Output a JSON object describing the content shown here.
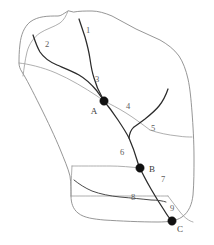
{
  "diagram": {
    "type": "watershed-stream-network",
    "title": "",
    "canvas": {
      "width": 214,
      "height": 245
    },
    "colors": {
      "background": "#ffffff",
      "basin_outline": "#8a8a8a",
      "sub_basin_divide": "#9a9a9a",
      "stream": "#2b2b2b",
      "node": "#111111",
      "reach_label_text": "#5d5d5d",
      "node_label_text": "#3a3a3a"
    },
    "reach_labels": [
      {
        "id": "reach-1",
        "label": "1",
        "x": 88,
        "y": 31
      },
      {
        "id": "reach-2",
        "label": "2",
        "x": 47,
        "y": 45
      },
      {
        "id": "reach-3",
        "label": "3",
        "x": 97,
        "y": 80
      },
      {
        "id": "reach-4",
        "label": "4",
        "x": 128,
        "y": 107
      },
      {
        "id": "reach-5",
        "label": "5",
        "x": 153,
        "y": 129
      },
      {
        "id": "reach-6",
        "label": "6",
        "x": 122,
        "y": 153
      },
      {
        "id": "reach-7",
        "label": "7",
        "x": 163,
        "y": 180
      },
      {
        "id": "reach-8",
        "label": "8",
        "x": 133,
        "y": 198
      },
      {
        "id": "reach-9",
        "label": "9",
        "x": 172,
        "y": 209
      }
    ],
    "nodes": [
      {
        "id": "node-a",
        "label": "A",
        "x": 104,
        "y": 101,
        "label_x": 94,
        "label_y": 112
      },
      {
        "id": "node-b",
        "label": "B",
        "x": 140,
        "y": 168,
        "label_x": 152,
        "label_y": 170
      },
      {
        "id": "node-c",
        "label": "C",
        "x": 172,
        "y": 221,
        "label_x": 180,
        "label_y": 230
      }
    ],
    "geometry": {
      "basin_outline": "M 68,11 C 63,14 61,16 58,16 C 48,16 38,16 30,22 C 24,27 21,35 20,44 C 19,52 19,58 19,63 C 19,66 20,69 22,72 C 26,78 33,92 40,106 C 48,122 55,137 60,149 C 64,159 68,168 70,176 C 71,183 71,190 71,196 C 71,203 73,209 78,213 C 84,218 94,219 104,220 C 120,221 140,222 158,222 C 168,222 176,221 182,217 C 189,212 192,204 193,195 C 194,183 194,170 194,158 C 194,142 193,125 192,112 C 191,99 190,88 188,79 C 186,70 183,62 179,56 C 174,49 167,44 160,40 C 152,36 144,33 136,29 C 128,25 120,20 112,16 C 105,13 98,11 92,11 C 85,11 79,11 74,12 Z",
      "divides": [
        "M 68,11 C 66,16 64,20 60,23 C 54,27 46,29 40,33 C 34,37 29,44 27,52 C 25,60 24,69 23,76",
        "M 19,63 C 28,64 42,67 56,73 C 70,79 85,88 97,96 C 100,98 102,100 104,101",
        "M 104,101 C 110,104 118,108 126,113 C 134,118 142,124 150,130",
        "M 150,130 C 158,133 168,135 178,136 C 184,137 189,137 192,137",
        "M 140,168 C 131,167 120,166 110,166 C 100,166 92,166 86,166 C 80,166 76,166 72,166",
        "M 72,166 C 72,172 71,179 71,186 C 71,191 71,194 71,196",
        "M 71,196 C 82,196 98,196 114,196 C 128,196 140,196 150,196 C 158,196 164,196 168,196",
        "M 168,196 C 172,201 176,207 180,212 C 185,218 189,221 193,222"
      ],
      "streams": [
        "M 79,19 C 81,25 83,31 85,37 C 87,44 89,52 90,59 C 91,66 92,72 94,78 C 96,85 99,92 102,97 C 103,99 104,100 104,101",
        "M 33,35 C 35,41 37,47 40,52 C 44,58 50,62 57,65 C 64,68 72,71 79,75 C 86,79 92,85 97,91 C 100,95 102,98 104,101",
        "M 104,101 C 109,107 114,114 118,120 C 122,126 126,132 129,138 C 132,145 135,153 137,160 C 138,164 139,166 140,168",
        "M 168,89 C 166,95 163,101 159,106 C 155,111 150,115 145,119 C 141,122 137,125 134,127 C 132,129 130,130 129,138",
        "M 140,168 C 143,175 147,182 151,189 C 155,196 160,204 164,210 C 167,215 170,219 172,221",
        "M 74,180 C 79,184 85,188 92,191 C 100,194 110,196 120,197 C 131,198 142,199 151,200 C 158,200 163,201 166,202"
      ]
    }
  }
}
